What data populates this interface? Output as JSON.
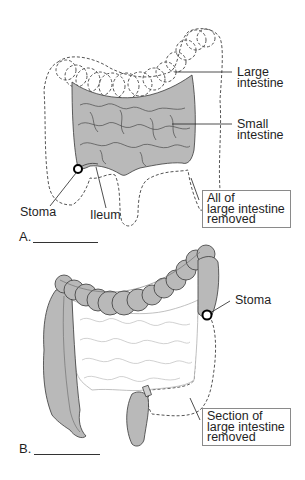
{
  "panels": [
    {
      "letter": "A.",
      "labels": {
        "large_intestine": "Large\nintestine",
        "small_intestine": "Small\nintestine",
        "stoma": "Stoma",
        "ileum": "Ileum"
      },
      "box": [
        "All of",
        "large intestine",
        "removed"
      ]
    },
    {
      "letter": "B.",
      "labels": {
        "stoma": "Stoma"
      },
      "box": [
        "Section of",
        "large intestine",
        "removed"
      ]
    }
  ],
  "colors": {
    "organ_fill": "#b9b9b9",
    "outline": "#3a3a3a",
    "removed_dash": "#555555",
    "background": "#ffffff"
  }
}
